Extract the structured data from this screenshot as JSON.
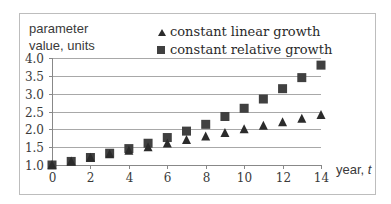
{
  "chart_data": {
    "type": "scatter",
    "title": "",
    "xlabel": "year, t",
    "ylabel": "parameter value, units",
    "x": [
      0,
      1,
      2,
      3,
      4,
      5,
      6,
      7,
      8,
      9,
      10,
      11,
      12,
      13,
      14
    ],
    "series": [
      {
        "name": "constant linear growth",
        "marker": "triangle",
        "values": [
          1.0,
          1.1,
          1.2,
          1.3,
          1.4,
          1.5,
          1.6,
          1.7,
          1.8,
          1.9,
          2.0,
          2.1,
          2.2,
          2.3,
          2.4
        ]
      },
      {
        "name": "constant relative growth",
        "marker": "square",
        "values": [
          1.0,
          1.1,
          1.21,
          1.33,
          1.46,
          1.61,
          1.77,
          1.95,
          2.14,
          2.36,
          2.59,
          2.85,
          3.14,
          3.45,
          3.8
        ]
      }
    ],
    "xlim": [
      0,
      14
    ],
    "ylim": [
      1.0,
      4.0
    ],
    "x_ticks": [
      "0",
      "2",
      "4",
      "6",
      "8",
      "10",
      "12",
      "14"
    ],
    "y_ticks": [
      "1.0",
      "1.5",
      "2.0",
      "2.5",
      "3.0",
      "3.5",
      "4.0"
    ],
    "grid": "horizontal",
    "legend_position": "top-right"
  },
  "labels": {
    "ylabel_line1": "parameter",
    "ylabel_line2": "value, units",
    "xlabel": "year, t",
    "legend_linear": "constant linear growth",
    "legend_relative": "constant relative growth"
  },
  "colors": {
    "marker": "#2b2b2b",
    "square_marker": "#404040",
    "grid": "#a8a8a8",
    "frame": "#bdbdbd"
  }
}
